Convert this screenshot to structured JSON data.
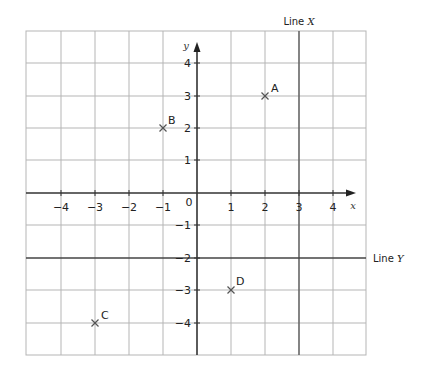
{
  "diagram": {
    "type": "coordinate-grid",
    "x_axis": {
      "label": "x",
      "ticks": [
        "-4",
        "-3",
        "-2",
        "-1",
        "1",
        "2",
        "3",
        "4"
      ],
      "origin_label": "0",
      "range": [
        -5,
        5
      ]
    },
    "y_axis": {
      "label": "y",
      "ticks": [
        "4",
        "3",
        "2",
        "1",
        "-1",
        "-2",
        "-3",
        "-4"
      ],
      "range": [
        -5,
        5
      ]
    },
    "lines": [
      {
        "name": "Line X",
        "prefix": "Line",
        "var": "X",
        "equation": "x = 3"
      },
      {
        "name": "Line Y",
        "prefix": "Line",
        "var": "Y",
        "equation": "y = -2"
      }
    ],
    "points": [
      {
        "label": "A",
        "x": 2,
        "y": 3
      },
      {
        "label": "B",
        "x": -1,
        "y": 2
      },
      {
        "label": "C",
        "x": -3,
        "y": -4
      },
      {
        "label": "D",
        "x": 1,
        "y": -3
      }
    ],
    "colors": {
      "grid": "#b5b5b5",
      "axis": "#333333",
      "special_line": "#555555",
      "marker": "#555555"
    }
  }
}
